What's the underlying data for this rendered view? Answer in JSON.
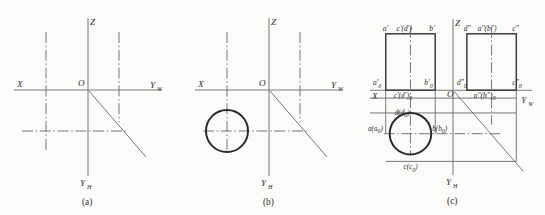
{
  "figure": {
    "panels": [
      {
        "id": "a",
        "caption": "(a)",
        "description": "Projection axes with 45-degree mitre line and centre lines",
        "axes": {
          "x_label": "X",
          "z_label": "Z",
          "origin_label": "O",
          "y_w_label": "Y",
          "y_w_sub": "W",
          "y_h_label": "Y",
          "y_h_sub": "H"
        }
      },
      {
        "id": "b",
        "caption": "(b)",
        "description": "Top view circle added in the third quadrant",
        "axes": {
          "x_label": "X",
          "z_label": "Z",
          "origin_label": "O",
          "y_w_label": "Y",
          "y_w_sub": "W",
          "y_h_label": "Y",
          "y_h_sub": "H"
        }
      },
      {
        "id": "c",
        "caption": "(c)",
        "description": "Completed three views with front and side rectangles and lettered points",
        "axes": {
          "x_label": "X",
          "z_label": "Z",
          "origin_label": "O",
          "y_w_label": "Y",
          "y_w_sub": "W",
          "y_h_label": "Y",
          "y_h_sub": "H"
        },
        "front_view_top_labels": [
          {
            "key": "a-prime",
            "text": "a′"
          },
          {
            "key": "c-prime-d-prime",
            "text": "c′(d′)"
          },
          {
            "key": "b-prime",
            "text": "b′"
          }
        ],
        "side_view_top_labels": [
          {
            "key": "d-double-prime",
            "text": "d″"
          },
          {
            "key": "a-double-prime-b-double-prime",
            "text": "a″(b″)"
          },
          {
            "key": "c-double-prime",
            "text": "c″"
          }
        ],
        "front_view_bottom_labels": [
          {
            "key": "a0-prime",
            "base": "a",
            "mark": "′",
            "sub": "0"
          },
          {
            "key": "b0-prime",
            "base": "b",
            "mark": "′",
            "sub": "0"
          },
          {
            "key": "c0-prime-d0-prime",
            "text": "c′(d′)",
            "sub": "0"
          }
        ],
        "side_view_bottom_labels": [
          {
            "key": "d0-double-prime",
            "base": "d",
            "mark": "″",
            "sub": "0"
          },
          {
            "key": "c0-double-prime",
            "base": "c",
            "mark": "″",
            "sub": "0"
          },
          {
            "key": "a0-b0-double-prime",
            "text": "a″(b″)",
            "sub": "0"
          }
        ],
        "top_view_labels": [
          {
            "key": "d-d0",
            "text": "d(d",
            "sub": "0",
            "tail": ")"
          },
          {
            "key": "a-a0",
            "text": "a(a",
            "sub": "0",
            "tail": ")"
          },
          {
            "key": "b-b0",
            "text": "b(b",
            "sub": "0",
            "tail": ")"
          },
          {
            "key": "c-c0",
            "text": "c(c",
            "sub": "0",
            "tail": ")"
          }
        ]
      }
    ],
    "colors": {
      "background": "#fbfbf9",
      "axis_line": "#7b7b7b",
      "thin_line": "#6f6f6f",
      "heavy_outline": "#2b2b2b",
      "rect_outline": "#3a3a3a",
      "text": "#2e2e2e"
    }
  }
}
